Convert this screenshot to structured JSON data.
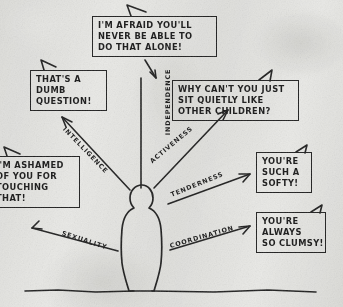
{
  "image": {
    "kind": "hand-drawn-diagram",
    "title": "Critical parental messages attacking a child's natural attributes",
    "ink_color": "#1d1d1d",
    "paper_color": "#e9e9e6"
  },
  "figure": {
    "name": "child-silhouette",
    "ground_line": "horizontal baseline across the bottom"
  },
  "balloons": [
    {
      "id": "independence",
      "lines": [
        "I'M AFRAID YOU'LL",
        "NEVER BE ABLE TO",
        "DO THAT ALONE!"
      ]
    },
    {
      "id": "intelligence",
      "lines": [
        "THAT'S A",
        "DUMB",
        "QUESTION!"
      ]
    },
    {
      "id": "activeness",
      "lines": [
        "WHY CAN'T YOU JUST",
        "SIT QUIETLY LIKE",
        "OTHER CHILDREN?"
      ]
    },
    {
      "id": "sexuality",
      "lines": [
        "I'M ASHAMED",
        "OF YOU FOR",
        "TOUCHING",
        "THAT!"
      ]
    },
    {
      "id": "tenderness",
      "lines": [
        "YOU'RE",
        "SUCH A",
        "SOFTY!"
      ]
    },
    {
      "id": "coordination",
      "lines": [
        "YOU'RE",
        "ALWAYS",
        "SO CLUMSY!"
      ]
    }
  ],
  "arrow_labels": {
    "intelligence": "INTELLIGENCE",
    "independence": "INDEPENDENCE",
    "activeness": "ACTIVENESS",
    "tenderness": "TENDERNESS",
    "coordination": "COORDINATION",
    "sexuality": "SEXUALITY"
  }
}
